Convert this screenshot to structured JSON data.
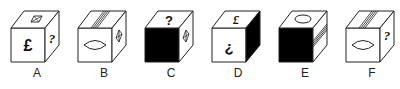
{
  "puzzle": {
    "cubes": [
      {
        "label": "A",
        "front": "pound-sign",
        "top": "crossed-square",
        "right": "question-mark",
        "front_fill": "white",
        "right_fill": "white"
      },
      {
        "label": "B",
        "front": "lens-shape",
        "top": "diagonal-stripes",
        "right": "crossed-diamond",
        "front_fill": "white",
        "right_fill": "white"
      },
      {
        "label": "C",
        "front": "black",
        "top": "question-mark",
        "right": "crossed-diamond",
        "front_fill": "black",
        "right_fill": "white"
      },
      {
        "label": "D",
        "front": "inverted-question-mark",
        "top": "pound-sign",
        "right": "black",
        "front_fill": "white",
        "right_fill": "black"
      },
      {
        "label": "E",
        "front": "black",
        "top": "ellipse",
        "right": "diagonal-stripes",
        "front_fill": "black",
        "right_fill": "white"
      },
      {
        "label": "F",
        "front": "lens-shape",
        "top": "diagonal-stripes",
        "right": "question-mark",
        "front_fill": "white",
        "right_fill": "white"
      }
    ],
    "symbols": {
      "pound": "£",
      "question": "?",
      "inverted_question": "¿"
    },
    "colors": {
      "stroke": "#222222",
      "fill": "#ffffff",
      "dark": "#000000"
    }
  }
}
